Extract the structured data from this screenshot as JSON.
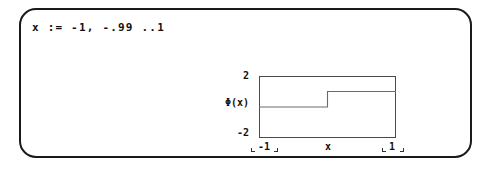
{
  "document": {
    "region_label": "math-region",
    "expression": "x := -1, -.99 ..1"
  },
  "chart_data": {
    "type": "line",
    "title": "",
    "xlabel": "x",
    "ylabel": "Φ(x)",
    "ylim": [
      -2,
      2
    ],
    "xlim": [
      -1,
      1
    ],
    "grid": false,
    "legend": null,
    "y_tick_labels": [
      "2",
      "-2"
    ],
    "y_axis_label": "Φ(x)",
    "x_tick_labels": [
      "-1",
      "1"
    ],
    "x_axis_label": "x",
    "series": [
      {
        "name": "Φ(x)",
        "comment": "Heaviside step: 0 for x<0, 1 for x>=0",
        "x": [
          -1,
          0,
          0,
          1
        ],
        "y": [
          0,
          0,
          1,
          1
        ]
      }
    ]
  },
  "colors": {
    "region_border": "#1a1a1a",
    "plot_border": "#4a4a4a",
    "trace": "#6a6a6a",
    "text": "#111111",
    "background": "#ffffff"
  }
}
